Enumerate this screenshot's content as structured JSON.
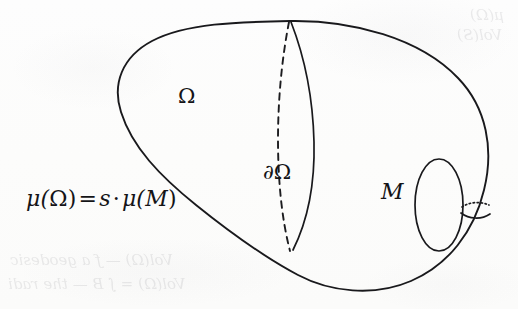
{
  "figure": {
    "kind": "mathematical-diagram",
    "background_color": "#fdfdfc",
    "ink_color": "#19191c",
    "labels": {
      "region": "Ω",
      "boundary": "∂Ω",
      "manifold": "M",
      "equation": "μ(Ω) = s · μ(M)",
      "equation_parts": {
        "mu_open_1": "μ(",
        "omega": "Ω",
        "close_1": ")",
        "equals": "=",
        "scalar": "s",
        "dot": "·",
        "mu_open_2": "μ(",
        "m": "M",
        "close_2": ")"
      }
    },
    "ghost_text": {
      "top_right_line_1": "μ(Ω)",
      "top_right_line_2": "Vol(S)",
      "bottom_left_line_1": "Vol(Ω) — ƒ a geodesic",
      "bottom_left_line_2": "Vol(Ω) = ∫ Β — the radi"
    },
    "parts": [
      {
        "name": "outer-body-outline",
        "description": "large egg-shaped closed curve forming the manifold M"
      },
      {
        "name": "boundary-curve-solid",
        "description": "solid meridian arc labelled ∂Ω"
      },
      {
        "name": "boundary-curve-dashed",
        "description": "dashed hidden meridian arc behind the surface"
      },
      {
        "name": "handle-hole-ellipse",
        "description": "vertical ellipse on the right showing the handle hole"
      },
      {
        "name": "handle-neck-solid",
        "description": "solid arc at the right forming the front of the handle tube"
      },
      {
        "name": "handle-neck-dotted",
        "description": "dotted arc showing the hidden back of the handle tube"
      }
    ]
  }
}
